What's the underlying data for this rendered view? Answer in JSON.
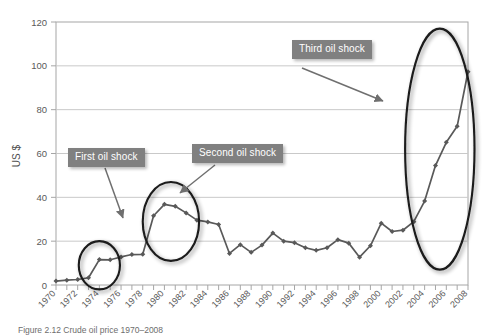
{
  "figure": {
    "caption": "Figure 2.12 Crude oil price 1970–2008"
  },
  "callouts": [
    {
      "id": "first",
      "label": "First oil shock"
    },
    {
      "id": "second",
      "label": "Second oil shock"
    },
    {
      "id": "third",
      "label": "Third oil shock"
    }
  ],
  "colors": {
    "callout_bg": "#808080",
    "callout_text": "#ffffff",
    "series_line": "#595959",
    "gridline": "#c9c9c9",
    "axis": "#a6a6a6",
    "ellipse": "#1a1a1a",
    "arrow": "#6f6f6f"
  },
  "chart_data": {
    "type": "line",
    "title": "",
    "xlabel": "",
    "ylabel": "US $",
    "ylim": [
      0,
      120
    ],
    "ytick_values": [
      0,
      20,
      40,
      60,
      80,
      100,
      120
    ],
    "ytick_labels": [
      "0",
      "20",
      "40",
      "60",
      "80",
      "100",
      "120"
    ],
    "xlim": [
      1970,
      2008
    ],
    "xtick_labels": [
      "1970",
      "1972",
      "1974",
      "1976",
      "1978",
      "1980",
      "1982",
      "1984",
      "1986",
      "1988",
      "1990",
      "1992",
      "1994",
      "1996",
      "1998",
      "2000",
      "2002",
      "2004",
      "2006",
      "2008"
    ],
    "grid": "horizontal",
    "legend": "none",
    "x": [
      1970,
      1971,
      1972,
      1973,
      1974,
      1975,
      1976,
      1977,
      1978,
      1979,
      1980,
      1981,
      1982,
      1983,
      1984,
      1985,
      1986,
      1987,
      1988,
      1989,
      1990,
      1991,
      1992,
      1993,
      1994,
      1995,
      1996,
      1997,
      1998,
      1999,
      2000,
      2001,
      2002,
      2003,
      2004,
      2005,
      2006,
      2007,
      2008
    ],
    "values": [
      1.8,
      2.2,
      2.5,
      3.3,
      11.6,
      11.5,
      12.8,
      13.9,
      14.0,
      31.6,
      36.8,
      35.9,
      32.9,
      29.6,
      28.8,
      27.6,
      14.4,
      18.4,
      14.9,
      18.2,
      23.7,
      20.0,
      19.3,
      17.0,
      15.8,
      17.0,
      20.7,
      19.1,
      12.7,
      17.9,
      28.2,
      24.4,
      25.0,
      28.9,
      38.3,
      54.5,
      65.1,
      72.4,
      97.3
    ],
    "annotations": [
      {
        "text": "First oil shock",
        "points_to_year": 1974,
        "points_to_value": 12
      },
      {
        "text": "Second oil shock",
        "points_to_year": 1981,
        "points_to_value": 37
      },
      {
        "text": "Third oil shock",
        "points_to_year": 2004,
        "points_to_value": 80
      }
    ],
    "highlight_ellipses": [
      {
        "name": "first-oil-shock-ellipse",
        "cx_year": 1974,
        "cy_value": 9,
        "rx_years": 1.9,
        "ry_value": 11
      },
      {
        "name": "second-oil-shock-ellipse",
        "cx_year": 1980.6,
        "cy_value": 29,
        "rx_years": 2.6,
        "ry_value": 18
      },
      {
        "name": "third-oil-shock-ellipse",
        "cx_year": 2005.4,
        "cy_value": 62,
        "rx_years": 3.2,
        "ry_value": 55
      }
    ]
  }
}
